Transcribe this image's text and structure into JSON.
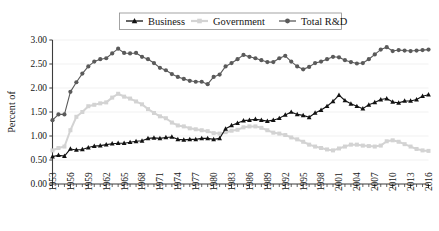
{
  "chart_data": {
    "type": "line",
    "title": "",
    "xlabel": "",
    "ylabel": "Percent of",
    "ylim": [
      0.0,
      3.0
    ],
    "ytick_values": [
      0.0,
      0.5,
      1.0,
      1.5,
      2.0,
      2.5,
      3.0
    ],
    "ytick_labels": [
      "0.00",
      "0.50",
      "1.00",
      "1.50",
      "2.00",
      "2.50",
      "3.00"
    ],
    "xlim": [
      1953,
      2016
    ],
    "xtick_labels": [
      "1953",
      "1956",
      "1959",
      "1962",
      "1965",
      "1968",
      "1971",
      "1974",
      "1977",
      "1980",
      "1983",
      "1986",
      "1989",
      "1992",
      "1995",
      "1998",
      "2001",
      "2004",
      "2007",
      "2010",
      "2013",
      "2016"
    ],
    "xtick_step_years": 3,
    "minor_tick_step_years": 1,
    "grid": "horizontal",
    "legend_position": "top-center",
    "x": [
      1953,
      1954,
      1955,
      1956,
      1957,
      1958,
      1959,
      1960,
      1961,
      1962,
      1963,
      1964,
      1965,
      1966,
      1967,
      1968,
      1969,
      1970,
      1971,
      1972,
      1973,
      1974,
      1975,
      1976,
      1977,
      1978,
      1979,
      1980,
      1981,
      1982,
      1983,
      1984,
      1985,
      1986,
      1987,
      1988,
      1989,
      1990,
      1991,
      1992,
      1993,
      1994,
      1995,
      1996,
      1997,
      1998,
      1999,
      2000,
      2001,
      2002,
      2003,
      2004,
      2005,
      2006,
      2007,
      2008,
      2009,
      2010,
      2011,
      2012,
      2013,
      2014,
      2015,
      2016
    ],
    "series": [
      {
        "name": "Business",
        "color": "#121212",
        "marker": "triangle",
        "values": [
          0.57,
          0.6,
          0.58,
          0.73,
          0.71,
          0.72,
          0.76,
          0.79,
          0.8,
          0.82,
          0.84,
          0.85,
          0.85,
          0.87,
          0.89,
          0.9,
          0.95,
          0.96,
          0.95,
          0.97,
          0.98,
          0.93,
          0.92,
          0.93,
          0.93,
          0.95,
          0.95,
          0.93,
          0.95,
          1.15,
          1.22,
          1.27,
          1.32,
          1.33,
          1.35,
          1.33,
          1.31,
          1.33,
          1.37,
          1.44,
          1.5,
          1.45,
          1.43,
          1.39,
          1.48,
          1.54,
          1.62,
          1.72,
          1.85,
          1.74,
          1.67,
          1.62,
          1.57,
          1.65,
          1.7,
          1.76,
          1.78,
          1.71,
          1.69,
          1.73,
          1.73,
          1.76,
          1.83,
          1.86
        ]
      },
      {
        "name": "Government",
        "color": "#d3d3d3",
        "marker": "square",
        "values": [
          0.7,
          0.75,
          0.78,
          1.12,
          1.4,
          1.5,
          1.62,
          1.65,
          1.68,
          1.7,
          1.8,
          1.88,
          1.82,
          1.78,
          1.72,
          1.66,
          1.56,
          1.48,
          1.41,
          1.37,
          1.28,
          1.22,
          1.2,
          1.16,
          1.14,
          1.12,
          1.1,
          1.06,
          1.05,
          1.08,
          1.11,
          1.13,
          1.18,
          1.2,
          1.2,
          1.17,
          1.12,
          1.07,
          1.05,
          1.02,
          0.97,
          0.93,
          0.88,
          0.82,
          0.78,
          0.75,
          0.72,
          0.7,
          0.74,
          0.78,
          0.82,
          0.82,
          0.8,
          0.79,
          0.78,
          0.8,
          0.89,
          0.91,
          0.88,
          0.83,
          0.78,
          0.73,
          0.7,
          0.69
        ]
      },
      {
        "name": "Total R&D",
        "color": "#5a5a5a",
        "marker": "circle",
        "values": [
          1.33,
          1.45,
          1.45,
          1.92,
          2.12,
          2.3,
          2.45,
          2.55,
          2.6,
          2.62,
          2.72,
          2.82,
          2.73,
          2.72,
          2.73,
          2.65,
          2.6,
          2.52,
          2.42,
          2.37,
          2.29,
          2.23,
          2.19,
          2.15,
          2.13,
          2.13,
          2.08,
          2.23,
          2.28,
          2.45,
          2.52,
          2.6,
          2.69,
          2.65,
          2.62,
          2.58,
          2.54,
          2.54,
          2.62,
          2.67,
          2.55,
          2.45,
          2.39,
          2.44,
          2.52,
          2.55,
          2.6,
          2.65,
          2.64,
          2.58,
          2.54,
          2.51,
          2.52,
          2.6,
          2.7,
          2.8,
          2.85,
          2.77,
          2.79,
          2.78,
          2.77,
          2.78,
          2.79,
          2.8
        ]
      }
    ]
  },
  "legend": {
    "items": [
      {
        "label": "Business"
      },
      {
        "label": "Government"
      },
      {
        "label": "Total R&D"
      }
    ]
  },
  "axis": {
    "y_title": "Percent of"
  },
  "footer": {
    "ghost_left": "",
    "ghost_mid": "",
    "ghost_right": ""
  }
}
